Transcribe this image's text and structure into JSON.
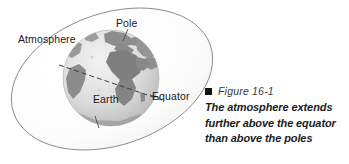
{
  "figure": {
    "kind": "science-textbook-diagram",
    "labels": {
      "atmosphere": "Atmosphere",
      "pole": "Pole",
      "earth": "Earth",
      "equator": "Equator"
    },
    "caption": {
      "bullet_icon": "filled-square-icon",
      "number": "Figure 16-1",
      "text": "The atmosphere extends further above the equator than above the poles"
    },
    "colors": {
      "background": "#ffffff",
      "atmosphere_fill": "#fbfbfb",
      "atmosphere_outline": "#8a8a8a",
      "ocean_light": "#e3e3e3",
      "land_dark": "#8e8e8e",
      "equator_line": "#4a4a4a",
      "label_text": "#1a1a1a",
      "caption_text": "#1b1b1b",
      "figure_number_text": "#3a3a3a"
    },
    "geometry": {
      "atmosphere_ellipse": {
        "cx": 112,
        "cy": 79,
        "rx": 104,
        "ry": 66,
        "rotation_deg": -19
      },
      "globe": {
        "cx": 111,
        "cy": 78,
        "r": 48
      },
      "equator_dash_angle_deg": 19
    }
  }
}
